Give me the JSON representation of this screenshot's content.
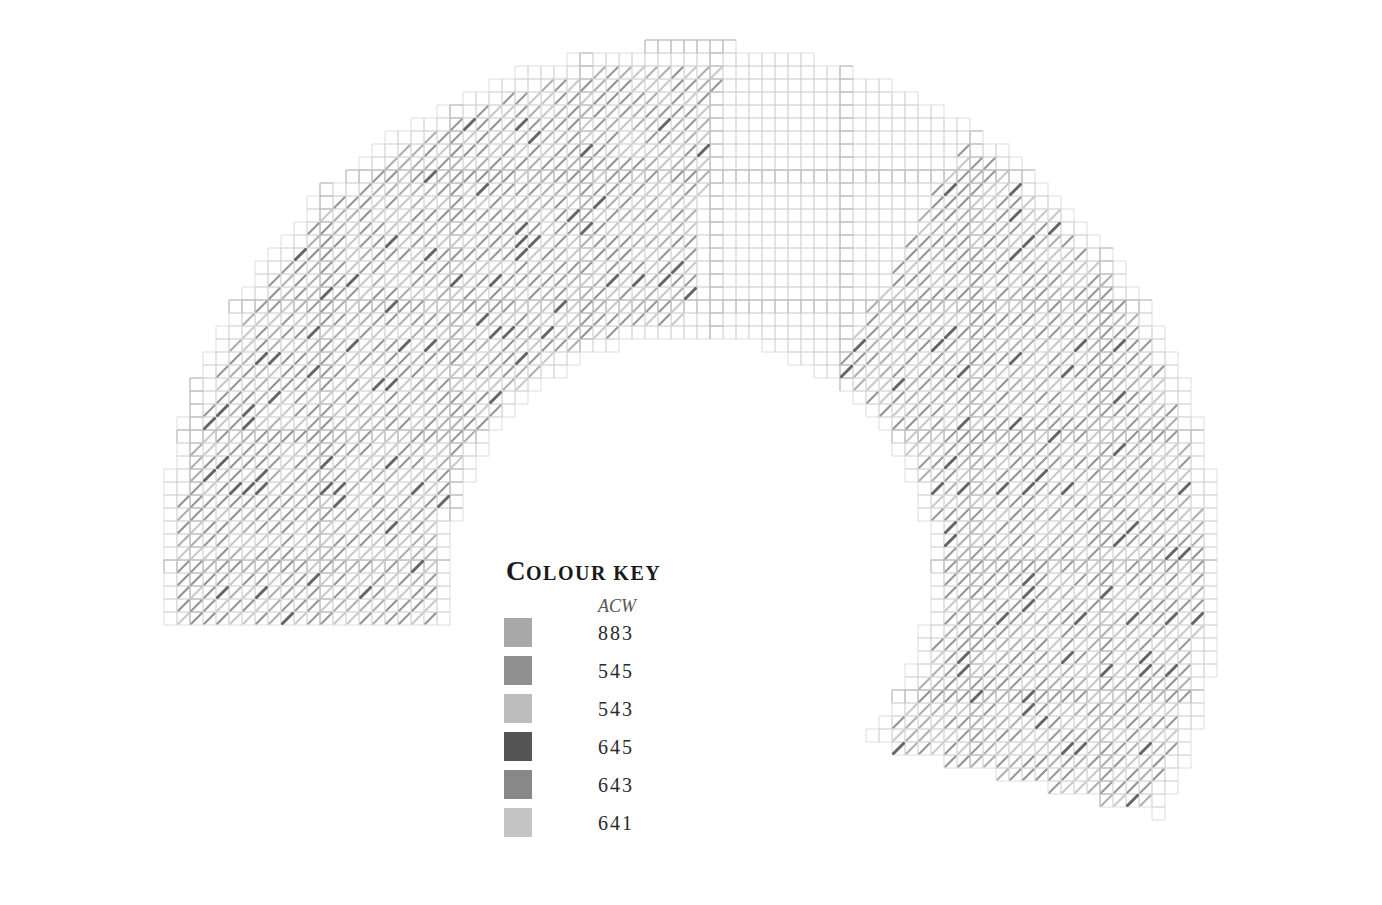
{
  "chart": {
    "type": "cross-stitch-pattern",
    "shape": "arch",
    "grid": {
      "cell_px": 13,
      "center_x": 690,
      "center_y": 575,
      "outer_radius": 530,
      "inner_radius": 240,
      "left_cut_y": 625,
      "right_cut_y": 850,
      "grid_color": "#cfcfcf",
      "major_grid_color": "#b8b8b8",
      "major_every": 10
    },
    "stitch_regions": [
      {
        "name": "left-band",
        "x_min": 70,
        "x_max": 720,
        "skew": 0.45
      },
      {
        "name": "right-band",
        "x_min": 810,
        "x_max": 1300,
        "skew": -0.55
      }
    ]
  },
  "colour_key": {
    "title_first": "C",
    "title_rest": "olour key",
    "subtitle": "ACW",
    "items": [
      {
        "code": "883",
        "color": "#a8a8a8"
      },
      {
        "code": "545",
        "color": "#8f8f8f"
      },
      {
        "code": "543",
        "color": "#bdbdbd"
      },
      {
        "code": "645",
        "color": "#555555"
      },
      {
        "code": "643",
        "color": "#888888"
      },
      {
        "code": "641",
        "color": "#c4c4c4"
      }
    ]
  }
}
